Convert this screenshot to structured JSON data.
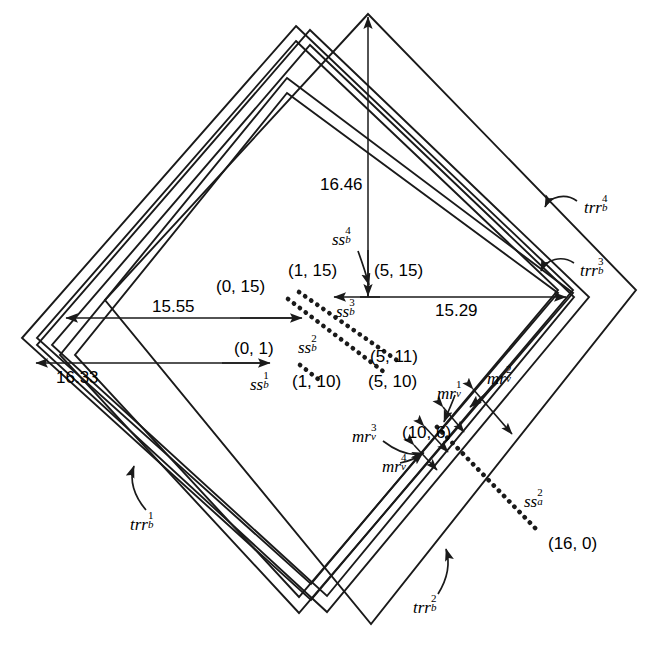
{
  "figure": {
    "type": "geometric-diagram"
  },
  "dimensions": [
    {
      "id": "dim-1646",
      "value": "16.46",
      "orientation": "vertical"
    },
    {
      "id": "dim-1555",
      "value": "15.55",
      "orientation": "horizontal"
    },
    {
      "id": "dim-1529",
      "value": "15.29",
      "orientation": "horizontal"
    },
    {
      "id": "dim-1633",
      "value": "16.33",
      "orientation": "horizontal"
    }
  ],
  "coordinates": [
    {
      "id": "pt-0-15",
      "value": "(0, 15)"
    },
    {
      "id": "pt-1-15",
      "value": "(1, 15)"
    },
    {
      "id": "pt-5-15",
      "value": "(5, 15)"
    },
    {
      "id": "pt-0-1",
      "value": "(0, 1)"
    },
    {
      "id": "pt-5-11",
      "value": "(5, 11)"
    },
    {
      "id": "pt-1-10",
      "value": "(1, 10)"
    },
    {
      "id": "pt-5-10",
      "value": "(5, 10)"
    },
    {
      "id": "pt-10-6",
      "value": "(10, 6)"
    },
    {
      "id": "pt-16-0",
      "value": "(16, 0)"
    }
  ],
  "symbols": {
    "ss_b_1": {
      "base": "ss",
      "sub": "b",
      "sup": "1"
    },
    "ss_b_2": {
      "base": "ss",
      "sub": "b",
      "sup": "2"
    },
    "ss_b_3": {
      "base": "ss",
      "sub": "b",
      "sup": "3"
    },
    "ss_b_4": {
      "base": "ss",
      "sub": "b",
      "sup": "4"
    },
    "ss_a_2": {
      "base": "ss",
      "sub": "a",
      "sup": "2"
    },
    "mr_v_1": {
      "base": "mr",
      "sub": "v",
      "sup": "1"
    },
    "mr_v_2": {
      "base": "mr",
      "sub": "v",
      "sup": "2"
    },
    "mr_v_3": {
      "base": "mr",
      "sub": "v",
      "sup": "3"
    },
    "mr_v_4": {
      "base": "mr",
      "sub": "v",
      "sup": "4"
    },
    "trr_b_1": {
      "base": "trr",
      "sub": "b",
      "sup": "1"
    },
    "trr_b_2": {
      "base": "trr",
      "sub": "b",
      "sup": "2"
    },
    "trr_b_3": {
      "base": "trr",
      "sub": "b",
      "sup": "3"
    },
    "trr_b_4": {
      "base": "trr",
      "sub": "b",
      "sup": "4"
    }
  },
  "colors": {
    "stroke": "#1a1a1a",
    "background": "#ffffff",
    "text": "#000000"
  }
}
